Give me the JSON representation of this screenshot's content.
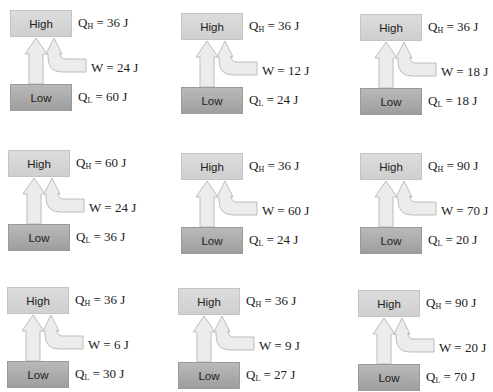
{
  "labels": {
    "high": "High",
    "low": "Low",
    "qh_symbol": "Q",
    "qh_sub": "H",
    "ql_symbol": "Q",
    "ql_sub": "L",
    "w_symbol": "W",
    "eq": " = ",
    "unit": "J"
  },
  "colors": {
    "high_box": "#d6d6d6",
    "low_box": "#a8a8a8",
    "arrow_fill": "#ececec",
    "arrow_stroke": "#bdbdbd"
  },
  "diagrams": [
    {
      "id": "r1c1",
      "qh": "36 J",
      "w": "24 J",
      "ql": "60 J"
    },
    {
      "id": "r1c2",
      "qh": "36 J",
      "w": "12 J",
      "ql": "24 J"
    },
    {
      "id": "r1c3",
      "qh": "36 J",
      "w": "18 J",
      "ql": "18 J"
    },
    {
      "id": "r2c1",
      "qh": "60 J",
      "w": "24 J",
      "ql": "36 J"
    },
    {
      "id": "r2c2",
      "qh": "36 J",
      "w": "60 J",
      "ql": "24 J"
    },
    {
      "id": "r2c3",
      "qh": "90 J",
      "w": "70 J",
      "ql": "20 J"
    },
    {
      "id": "r3c1",
      "qh": "36 J",
      "w": "6 J",
      "ql": "30 J"
    },
    {
      "id": "r3c2",
      "qh": "36 J",
      "w": "9 J",
      "ql": "27 J"
    },
    {
      "id": "r3c3",
      "qh": "90 J",
      "w": "20 J",
      "ql": "70 J"
    }
  ]
}
